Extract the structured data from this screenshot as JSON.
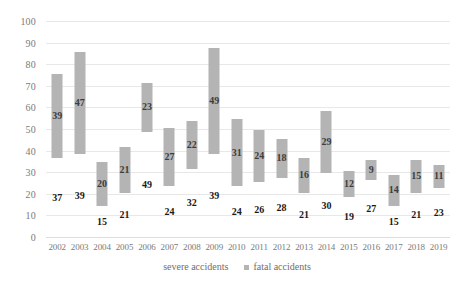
{
  "chart_data": {
    "type": "bar",
    "title": "",
    "subtitle": "",
    "xlabel": "",
    "ylabel": "",
    "ylim": [
      0,
      100
    ],
    "ytick_step": 10,
    "yticks": [
      "0",
      "10",
      "20",
      "30",
      "40",
      "50",
      "60",
      "70",
      "80",
      "90",
      "100"
    ],
    "grid": true,
    "stacked": true,
    "legend_position": "bottom",
    "categories": [
      "2002",
      "2003",
      "2004",
      "2005",
      "2006",
      "2007",
      "2008",
      "2009",
      "2010",
      "2011",
      "2012",
      "2013",
      "2014",
      "2015",
      "2016",
      "2017",
      "2018",
      "2019"
    ],
    "series": [
      {
        "name": "severe accidents",
        "color": "#ffffff",
        "visible_bar": false,
        "values": [
          37,
          39,
          15,
          21,
          49,
          24,
          32,
          39,
          24,
          26,
          28,
          21,
          30,
          19,
          27,
          15,
          21,
          23
        ]
      },
      {
        "name": "fatal accidents",
        "color": "#b4b4b4",
        "visible_bar": true,
        "values": [
          39,
          47,
          20,
          21,
          23,
          27,
          22,
          49,
          31,
          24,
          18,
          16,
          29,
          12,
          9,
          14,
          15,
          11
        ]
      }
    ]
  },
  "colors": {
    "bar_fill": "#b4b4b4",
    "gridline": "#e8e8e8",
    "axis_text": "#7a7a7a",
    "data_label": "#1a1a1a",
    "background": "#ffffff"
  }
}
